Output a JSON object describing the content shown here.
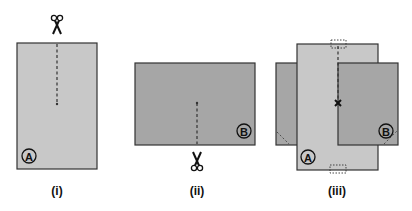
{
  "figures": [
    {
      "id": "i",
      "caption": "(i)",
      "label": "A",
      "description": "Tall light-gray rectangle with a dashed cut line from the top center down to the middle; scissors above the top edge."
    },
    {
      "id": "ii",
      "caption": "(ii)",
      "label": "B",
      "description": "Wide darker-gray rectangle with a dashed cut line from the bottom center up to the middle; scissors below the bottom edge."
    },
    {
      "id": "iii",
      "caption": "(iii)",
      "label_a": "A",
      "label_b": "B",
      "description": "Both pieces slotted together through their cuts, crossing at an x mark; dotted rectangles mark the top and bottom ends of the cut."
    }
  ],
  "colors": {
    "piece_a": "#c8c8c8",
    "piece_b": "#a6a6a6",
    "outline": "#333333",
    "background": "#ffffff"
  },
  "labels": {
    "a": "A",
    "b": "B",
    "cap_i": "(i)",
    "cap_ii": "(ii)",
    "cap_iii": "(iii)"
  }
}
